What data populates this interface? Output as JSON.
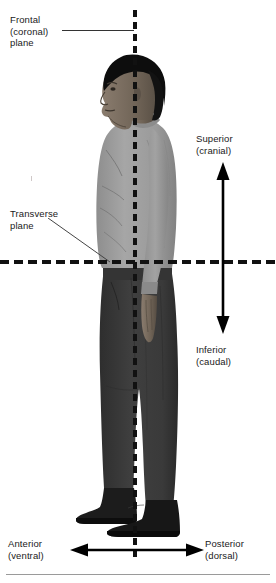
{
  "figure": {
    "background_color": "#ffffff",
    "text_color": "#1a1a1a"
  },
  "planes": {
    "frontal": {
      "label_line1": "Frontal",
      "label_line2": "(coronal)",
      "label_line3": "plane",
      "orientation": "vertical",
      "style": "dashed",
      "color": "#111111"
    },
    "transverse": {
      "label_line1": "Transverse",
      "label_line2": "plane",
      "orientation": "horizontal",
      "style": "dashed",
      "color": "#111111"
    }
  },
  "directions": {
    "superior": {
      "label_line1": "Superior",
      "label_line2": "(cranial)",
      "arrow": "up-arrow-icon"
    },
    "inferior": {
      "label_line1": "Inferior",
      "label_line2": "(caudal)",
      "arrow": "down-arrow-icon"
    },
    "anterior": {
      "label_line1": "Anterior",
      "label_line2": "(ventral)",
      "arrow": "left-arrow-icon"
    },
    "posterior": {
      "label_line1": "Posterior",
      "label_line2": "(dorsal)",
      "arrow": "right-arrow-icon"
    }
  },
  "subject": {
    "description": "Man standing in left lateral profile view",
    "hair_color": "#0d0d0d",
    "skin_color": "#6e6256",
    "shirt_color": "#9a9a9a",
    "trousers_color": "#3a3a3a",
    "shoes_color": "#141414"
  }
}
